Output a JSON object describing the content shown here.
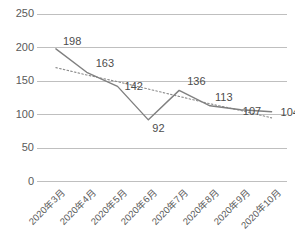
{
  "chart_data": {
    "type": "line",
    "title": "",
    "xlabel": "",
    "ylabel": "",
    "ylim": [
      0,
      250
    ],
    "yticks": [
      0,
      50,
      100,
      150,
      200,
      250
    ],
    "grid": true,
    "legend": false,
    "categories": [
      "2020年3月",
      "2020年4月",
      "2020年5月",
      "2020年6月",
      "2020年7月",
      "2020年8月",
      "2020年9月",
      "2020年10月"
    ],
    "series": [
      {
        "name": "series-1",
        "style": "solid",
        "color": "#808080",
        "values": [
          198,
          163,
          142,
          92,
          136,
          113,
          107,
          104
        ],
        "labels": [
          "198",
          "163",
          "142",
          "92",
          "136",
          "113",
          "107",
          "104"
        ]
      },
      {
        "name": "trendline",
        "style": "dotted",
        "color": "#8c8c8c",
        "values": [
          170,
          159,
          149,
          138,
          127,
          116,
          106,
          95
        ]
      }
    ],
    "ytick_labels": [
      "250",
      "200",
      "150",
      "100",
      "50",
      "0"
    ],
    "colors": {
      "gridline": "#bfbfbf",
      "axis_text": "#5a5a5a",
      "data_label": "#4d4d4d",
      "background": "#ffffff"
    }
  }
}
